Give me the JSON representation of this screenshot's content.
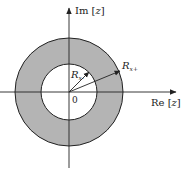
{
  "diagram": {
    "type": "z-plane region of convergence (annulus)",
    "colors": {
      "ring_fill": "#b4b4b4",
      "inner_fill": "#ffffff",
      "stroke": "#222222",
      "background": "#ffffff"
    },
    "axes": {
      "imag_label_prefix": "Im [",
      "imag_label_var": "z",
      "imag_label_suffix": "]",
      "real_label_prefix": "Re [",
      "real_label_var": "z",
      "real_label_suffix": "]",
      "origin_label": "0"
    },
    "radii": {
      "inner": {
        "symbol": "R",
        "subscript": "x-"
      },
      "outer": {
        "symbol": "R",
        "subscript": "x+"
      }
    }
  }
}
